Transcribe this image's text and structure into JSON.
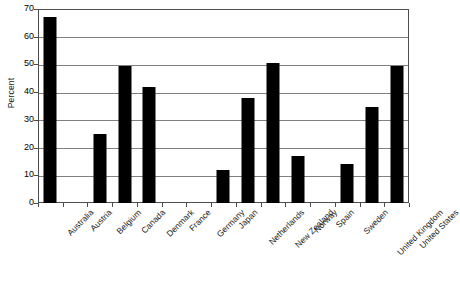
{
  "chart_data": {
    "type": "bar",
    "title": "",
    "xlabel": "",
    "ylabel": "Percent",
    "ylim": [
      0,
      70
    ],
    "yticks": [
      0,
      10,
      20,
      30,
      40,
      50,
      60,
      70
    ],
    "ytick_labels": [
      "0",
      "10",
      "20",
      "30",
      "40",
      "50",
      "60",
      "70"
    ],
    "grid": "horizontal",
    "legend": "none",
    "bar_color": "#000000",
    "categories": [
      "Australia",
      "Austria",
      "Belgium",
      "Canada",
      "Denmark",
      "France",
      "Germany",
      "Japan",
      "Netherlands",
      "New Zealand",
      "Norway",
      "Spain",
      "Sweden",
      "United Kingdom",
      "United States"
    ],
    "values": [
      67,
      0,
      25,
      49.5,
      42,
      0,
      0,
      12,
      38,
      50.5,
      17,
      0,
      14,
      34.5,
      49.5
    ]
  }
}
